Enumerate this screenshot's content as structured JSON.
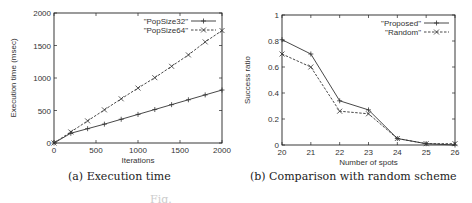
{
  "chart_data": [
    {
      "type": "line",
      "title": "",
      "xlabel": "Iterations",
      "ylabel": "Execution time (msec)",
      "xlim": [
        0,
        2000
      ],
      "ylim": [
        0,
        2000
      ],
      "xticks": [
        "0",
        "500",
        "1000",
        "1500",
        "2000"
      ],
      "yticks": [
        "0",
        "500",
        "1000",
        "1500",
        "2000"
      ],
      "grid": false,
      "legend_position": "top-right",
      "x": [
        0,
        200,
        400,
        600,
        800,
        1000,
        1200,
        1400,
        1600,
        1800,
        2000
      ],
      "series": [
        {
          "name": "\"PopSize32\"",
          "marker": "+",
          "style": "solid",
          "values": [
            0,
            150,
            220,
            290,
            365,
            440,
            515,
            590,
            665,
            740,
            815
          ]
        },
        {
          "name": "\"PopSize64\"",
          "marker": "x",
          "style": "dashed",
          "values": [
            0,
            170,
            340,
            510,
            680,
            845,
            1005,
            1180,
            1355,
            1555,
            1730
          ]
        }
      ]
    },
    {
      "type": "line",
      "title": "",
      "xlabel": "Number of spots",
      "ylabel": "Success ratio",
      "xlim": [
        20,
        26
      ],
      "ylim": [
        0,
        1
      ],
      "xticks": [
        "20",
        "21",
        "22",
        "23",
        "24",
        "25",
        "26"
      ],
      "yticks": [
        "0",
        "0.2",
        "0.4",
        "0.6",
        "0.8",
        "1"
      ],
      "grid": false,
      "legend_position": "top-right",
      "x": [
        20,
        21,
        22,
        23,
        24,
        25,
        26
      ],
      "series": [
        {
          "name": "\"Proposed\"",
          "marker": "+",
          "style": "solid",
          "values": [
            0.81,
            0.7,
            0.34,
            0.27,
            0.05,
            0.01,
            0.0
          ]
        },
        {
          "name": "\"Random\"",
          "marker": "x",
          "style": "dashed",
          "values": [
            0.7,
            0.6,
            0.26,
            0.24,
            0.05,
            0.01,
            0.01
          ]
        }
      ]
    }
  ],
  "captions": {
    "a": "(a) Execution time",
    "b": "(b) Comparison with random scheme",
    "figure": "Fig."
  },
  "colors": {
    "line": "#333333",
    "axis": "#222222"
  }
}
